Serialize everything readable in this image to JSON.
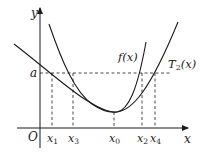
{
  "diagram": {
    "type": "function-graph",
    "axes": {
      "x_label": "x",
      "y_label": "y",
      "origin_label": "O"
    },
    "curves": [
      {
        "name": "f",
        "label": "f(x)",
        "description": "steeper convex curve with minimum at x0"
      },
      {
        "name": "T2",
        "label_main": "T",
        "label_sub": "2",
        "label_args": "(x)",
        "description": "wider convex (Taylor polynomial) curve with minimum at x0"
      }
    ],
    "level": {
      "label": "a",
      "style": "dashed horizontal line"
    },
    "x_ticks": [
      {
        "main": "x",
        "sub": "1"
      },
      {
        "main": "x",
        "sub": "3"
      },
      {
        "main": "x",
        "sub": "0"
      },
      {
        "main": "x",
        "sub": "2"
      },
      {
        "main": "x",
        "sub": "4"
      }
    ],
    "colors": {
      "stroke": "#1a1a1a",
      "background": "#ffffff"
    }
  }
}
